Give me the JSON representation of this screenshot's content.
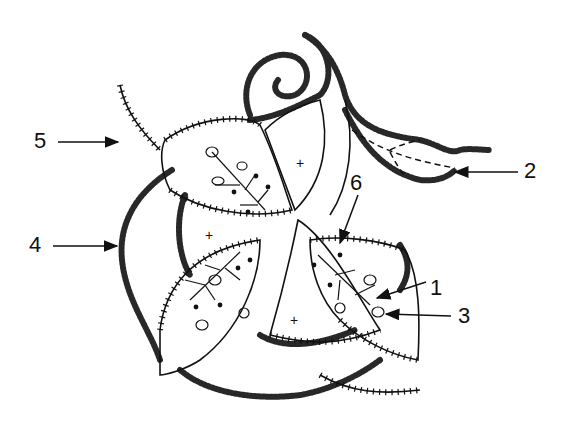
{
  "diagram": {
    "type": "embroidery-stitch-diagram",
    "colors": {
      "ink": "#111111",
      "background": "#ffffff"
    },
    "labels": [
      {
        "id": "1",
        "text": "1",
        "x": 430,
        "y": 277
      },
      {
        "id": "2",
        "text": "2",
        "x": 524,
        "y": 160
      },
      {
        "id": "3",
        "text": "3",
        "x": 458,
        "y": 312
      },
      {
        "id": "4",
        "text": "4",
        "x": 29,
        "y": 234
      },
      {
        "id": "5",
        "text": "5",
        "x": 36,
        "y": 128
      },
      {
        "id": "6",
        "text": "6",
        "x": 353,
        "y": 172
      }
    ],
    "center_marks": [
      "+",
      "+",
      "+",
      "+"
    ]
  }
}
